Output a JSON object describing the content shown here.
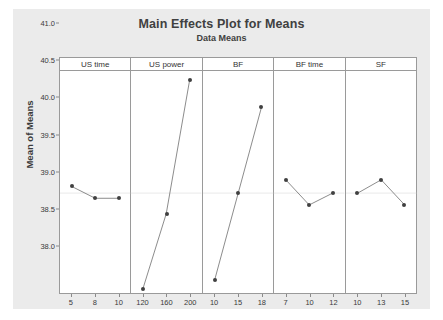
{
  "chart_data": {
    "type": "line",
    "title": "Main Effects Plot for Means",
    "subtitle": "Data Means",
    "xlabel": "",
    "ylabel": "Mean of Means",
    "ylim": [
      38.0,
      41.0
    ],
    "yticks": [
      "38.0",
      "38.5",
      "39.0",
      "39.5",
      "40.0",
      "40.5",
      "41.0"
    ],
    "grid": false,
    "legend": "none",
    "reference_line": 39.35,
    "panels": [
      {
        "name": "US time",
        "categories": [
          "5",
          "8",
          "10"
        ],
        "values": [
          39.44,
          39.28,
          39.28
        ]
      },
      {
        "name": "US power",
        "categories": [
          "120",
          "160",
          "200"
        ],
        "values": [
          38.05,
          39.07,
          40.88
        ]
      },
      {
        "name": "BF",
        "categories": [
          "10",
          "15",
          "18"
        ],
        "values": [
          38.18,
          39.35,
          40.52
        ]
      },
      {
        "name": "BF time",
        "categories": [
          "7",
          "10",
          "12"
        ],
        "values": [
          39.53,
          39.19,
          39.35
        ]
      },
      {
        "name": "SF",
        "categories": [
          "10",
          "13",
          "15"
        ],
        "values": [
          39.35,
          39.53,
          39.19
        ]
      }
    ],
    "colors": {
      "figure_background": "#ebebeb",
      "panel_background": "#ffffff",
      "marker": "#404040",
      "line": "#6e6e6e",
      "reference_line": "#d8d8d8",
      "frame": "#9a9a9a",
      "text": "#3a3a3a"
    }
  }
}
